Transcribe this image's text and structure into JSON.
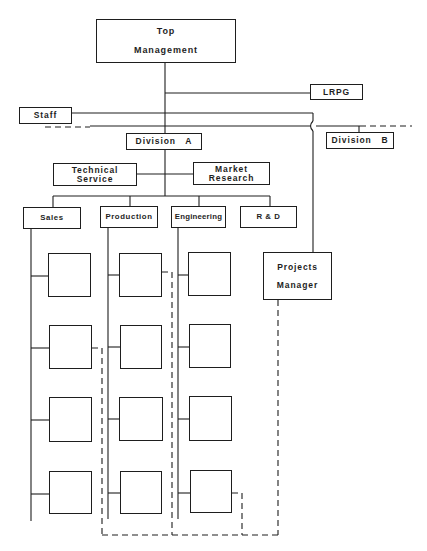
{
  "diagram": {
    "type": "organization chart",
    "nodes": {
      "top_management": {
        "line1": "Top",
        "line2": "Management"
      },
      "lrpg": {
        "label": "LRPG"
      },
      "staff": {
        "label": "Staff"
      },
      "division_a": {
        "label": "Division   A"
      },
      "division_b": {
        "label": "Division   B"
      },
      "technical_service": {
        "line1": "Technical",
        "line2": "Service"
      },
      "market_research": {
        "line1": "Market",
        "line2": "Research"
      },
      "sales": {
        "label": "Sales"
      },
      "production": {
        "label": "Production"
      },
      "engineering": {
        "label": "Engineering"
      },
      "rnd": {
        "label": "R & D"
      },
      "projects_manager": {
        "line1": "Projects",
        "line2": "Manager"
      }
    },
    "sub_units": {
      "sales": 4,
      "production": 4,
      "engineering": 4
    },
    "legend": {
      "solid_line": "line authority",
      "dashed_line": "project relationship"
    },
    "colors": {
      "line": "#1e1e1e",
      "background": "#ffffff"
    }
  }
}
